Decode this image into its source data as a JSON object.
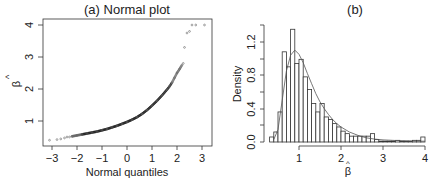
{
  "chart_data": [
    {
      "type": "scatter",
      "title": "(a) Normal plot",
      "xlabel": "Normal quantiles",
      "ylabel": "β̂",
      "xlim": [
        -3.2,
        3.3
      ],
      "ylim": [
        0.3,
        4.1
      ],
      "xticks": [
        "-3",
        "-2",
        "-1",
        "0",
        "1",
        "2",
        "3"
      ],
      "yticks": [
        "1",
        "2",
        "3",
        "4"
      ],
      "grid": false,
      "description": "Normal Q-Q plot of beta-hat estimates; convex upward curve indicating right skew",
      "points": [
        [
          -3.1,
          0.4
        ],
        [
          -2.8,
          0.42
        ],
        [
          -2.65,
          0.44
        ],
        [
          -2.5,
          0.47
        ],
        [
          -2.4,
          0.5
        ],
        [
          -2.3,
          0.5
        ],
        [
          -2.2,
          0.52
        ],
        [
          -2.0,
          0.55
        ],
        [
          -1.8,
          0.58
        ],
        [
          -1.6,
          0.61
        ],
        [
          -1.4,
          0.64
        ],
        [
          -1.2,
          0.67
        ],
        [
          -1.0,
          0.71
        ],
        [
          -0.8,
          0.75
        ],
        [
          -0.6,
          0.8
        ],
        [
          -0.4,
          0.85
        ],
        [
          -0.2,
          0.91
        ],
        [
          0.0,
          0.97
        ],
        [
          0.2,
          1.04
        ],
        [
          0.4,
          1.12
        ],
        [
          0.6,
          1.22
        ],
        [
          0.8,
          1.34
        ],
        [
          1.0,
          1.48
        ],
        [
          1.2,
          1.63
        ],
        [
          1.4,
          1.8
        ],
        [
          1.6,
          1.98
        ],
        [
          1.7,
          2.08
        ],
        [
          1.8,
          2.2
        ],
        [
          1.9,
          2.35
        ],
        [
          2.0,
          2.5
        ],
        [
          2.1,
          2.62
        ],
        [
          2.2,
          2.75
        ],
        [
          2.25,
          2.8
        ],
        [
          2.3,
          3.3
        ],
        [
          2.4,
          3.75
        ],
        [
          2.5,
          3.8
        ],
        [
          2.6,
          4.0
        ],
        [
          2.75,
          4.0
        ],
        [
          3.1,
          4.0
        ]
      ]
    },
    {
      "type": "bar",
      "title": "(b)",
      "xlabel": "β̂",
      "ylabel": "Density",
      "xlim": [
        0.3,
        4.0
      ],
      "ylim": [
        0.0,
        1.4
      ],
      "xticks": [
        "1",
        "2",
        "3",
        "4"
      ],
      "yticks": [
        "0.0",
        "0.4",
        "0.8",
        "1.2"
      ],
      "grid": false,
      "description": "Histogram of beta-hat with overlaid smooth density curve",
      "bin_width": 0.1,
      "categories": [
        0.35,
        0.45,
        0.55,
        0.65,
        0.75,
        0.85,
        0.95,
        1.05,
        1.15,
        1.25,
        1.35,
        1.45,
        1.55,
        1.65,
        1.75,
        1.85,
        1.95,
        2.05,
        2.15,
        2.25,
        2.35,
        2.45,
        2.55,
        2.65,
        2.75,
        2.85,
        2.95,
        3.05,
        3.15,
        3.25,
        3.35,
        3.45,
        3.55,
        3.65,
        3.75,
        3.85,
        3.95
      ],
      "values": [
        0.06,
        0.12,
        0.36,
        1.08,
        0.9,
        1.35,
        0.94,
        0.99,
        0.78,
        0.63,
        0.46,
        0.36,
        0.46,
        0.3,
        0.27,
        0.22,
        0.18,
        0.13,
        0.1,
        0.07,
        0.07,
        0.07,
        0.07,
        0.07,
        0.1,
        0.03,
        0.01,
        0.01,
        0.01,
        0.01,
        0.02,
        0.01,
        0.01,
        0.01,
        0.02,
        0.02,
        0.06
      ],
      "series": [
        {
          "name": "density curve",
          "x": [
            0.4,
            0.5,
            0.6,
            0.7,
            0.8,
            0.9,
            1.0,
            1.1,
            1.2,
            1.3,
            1.4,
            1.5,
            1.6,
            1.7,
            1.8,
            1.9,
            2.0,
            2.2,
            2.4,
            2.6,
            2.8,
            3.0,
            3.4,
            3.8,
            4.0
          ],
          "values": [
            0.03,
            0.15,
            0.5,
            0.85,
            1.04,
            1.1,
            1.05,
            0.95,
            0.82,
            0.7,
            0.58,
            0.48,
            0.4,
            0.33,
            0.27,
            0.22,
            0.18,
            0.12,
            0.08,
            0.05,
            0.035,
            0.025,
            0.015,
            0.01,
            0.01
          ]
        }
      ]
    }
  ],
  "panels": {
    "a": {
      "title": "(a) Normal plot",
      "xlabel": "Normal quantiles",
      "ylabel_symbol": "β",
      "ylabel_hat": "^",
      "xticks": [
        "−3",
        "−2",
        "−1",
        "0",
        "1",
        "2",
        "3"
      ],
      "yticks": [
        "1",
        "2",
        "3",
        "4"
      ]
    },
    "b": {
      "title": "(b)",
      "ylabel": "Density",
      "xlabel_symbol": "β",
      "xlabel_hat": "^",
      "xticks": [
        "1",
        "2",
        "3",
        "4"
      ],
      "yticks": [
        "0.0",
        "0.4",
        "0.8",
        "1.2"
      ]
    }
  }
}
